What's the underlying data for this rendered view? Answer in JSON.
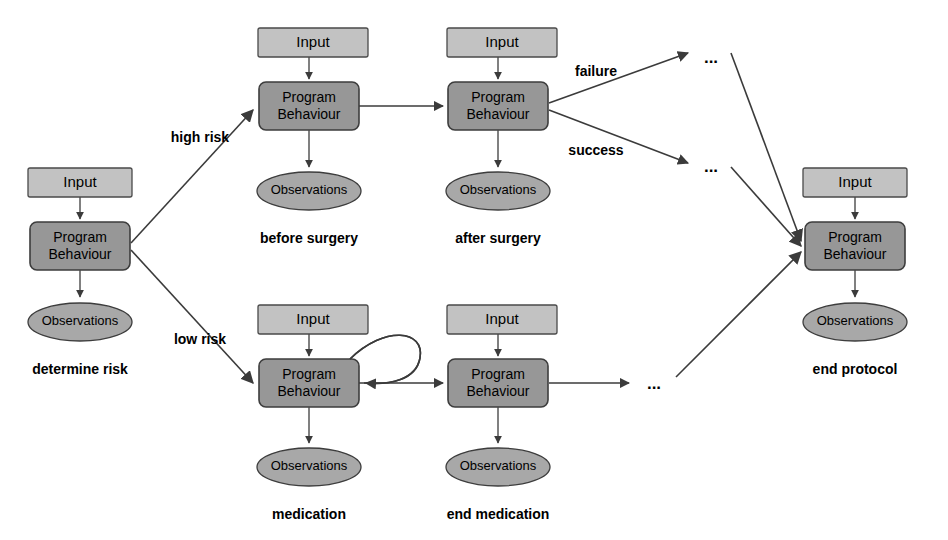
{
  "diagram": {
    "canvas": {
      "width": 948,
      "height": 540
    },
    "colors": {
      "input_fill": "#c2c2c2",
      "behaviour_fill": "#979797",
      "observation_fill": "#a8a8a8",
      "stroke": "#3b3b3b",
      "background": "#ffffff",
      "text": "#000000"
    },
    "node_labels": {
      "input": "Input",
      "behaviour_line1": "Program",
      "behaviour_line2": "Behaviour",
      "observations": "Observations"
    },
    "groups": [
      {
        "id": "determine-risk",
        "caption": "determine risk",
        "input": "Input",
        "behaviour_line1": "Program",
        "behaviour_line2": "Behaviour",
        "observations": "Observations"
      },
      {
        "id": "before-surgery",
        "caption": "before surgery",
        "input": "Input",
        "behaviour_line1": "Program",
        "behaviour_line2": "Behaviour",
        "observations": "Observations"
      },
      {
        "id": "after-surgery",
        "caption": "after surgery",
        "input": "Input",
        "behaviour_line1": "Program",
        "behaviour_line2": "Behaviour",
        "observations": "Observations"
      },
      {
        "id": "medication",
        "caption": "medication",
        "input": "Input",
        "behaviour_line1": "Program",
        "behaviour_line2": "Behaviour",
        "observations": "Observations"
      },
      {
        "id": "end-medication",
        "caption": "end medication",
        "input": "Input",
        "behaviour_line1": "Program",
        "behaviour_line2": "Behaviour",
        "observations": "Observations"
      },
      {
        "id": "end-protocol",
        "caption": "end protocol",
        "input": "Input",
        "behaviour_line1": "Program",
        "behaviour_line2": "Behaviour",
        "observations": "Observations"
      }
    ],
    "edge_labels": [
      {
        "id": "high-risk",
        "text": "high risk"
      },
      {
        "id": "low-risk",
        "text": "low risk"
      },
      {
        "id": "failure",
        "text": "failure"
      },
      {
        "id": "success",
        "text": "success"
      }
    ],
    "ellipsis_markers": [
      {
        "id": "failure-continuation",
        "text": "..."
      },
      {
        "id": "success-continuation",
        "text": "..."
      },
      {
        "id": "medication-continuation",
        "text": "..."
      }
    ]
  }
}
